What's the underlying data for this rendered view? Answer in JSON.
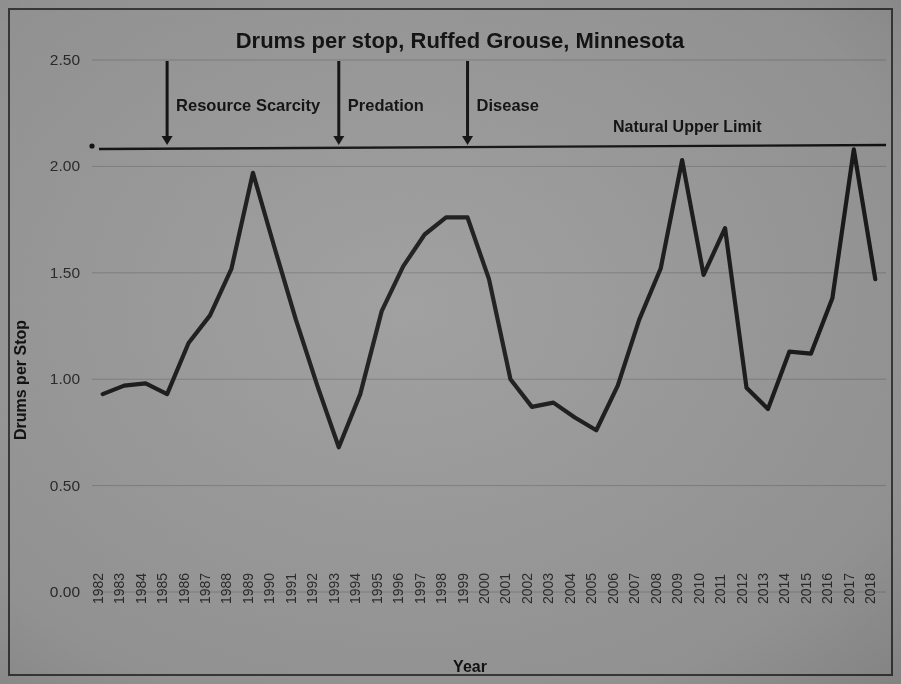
{
  "figure": {
    "background_color": "#9c9c9c",
    "border_color": "#3a3a3a",
    "line_color": "#1a1a1a"
  },
  "chart_data": {
    "type": "line",
    "title": "Drums per stop, Ruffed Grouse, Minnesota",
    "xlabel": "Year",
    "ylabel": "Drums per Stop",
    "grid": true,
    "legend_position": "none",
    "xlim": [
      1982,
      2018
    ],
    "ylim": [
      0.0,
      2.5
    ],
    "ytick_labels": [
      "0.00",
      "0.50",
      "1.00",
      "1.50",
      "2.00",
      "2.50"
    ],
    "ytick_values": [
      0.0,
      0.5,
      1.0,
      1.5,
      2.0,
      2.5
    ],
    "categories": [
      "1982",
      "1983",
      "1984",
      "1985",
      "1986",
      "1987",
      "1988",
      "1989",
      "1990",
      "1991",
      "1992",
      "1993",
      "1994",
      "1995",
      "1996",
      "1997",
      "1998",
      "1999",
      "2000",
      "2001",
      "2002",
      "2003",
      "2004",
      "2005",
      "2006",
      "2007",
      "2008",
      "2009",
      "2010",
      "2011",
      "2012",
      "2013",
      "2014",
      "2015",
      "2016",
      "2017",
      "2018"
    ],
    "series": [
      {
        "name": "Drums per Stop",
        "values": [
          0.93,
          0.97,
          0.98,
          0.93,
          1.17,
          1.3,
          1.52,
          1.97,
          1.62,
          1.28,
          0.97,
          0.68,
          0.93,
          1.32,
          1.53,
          1.68,
          1.76,
          1.76,
          1.47,
          1.0,
          0.87,
          0.89,
          0.82,
          0.76,
          0.97,
          1.28,
          1.52,
          2.03,
          1.49,
          1.71,
          0.96,
          0.86,
          1.13,
          1.12,
          1.38,
          2.08,
          1.47
        ]
      }
    ],
    "reference_lines": [
      {
        "name": "natural-upper-limit",
        "label": "Natural Upper Limit",
        "value": 2.11
      }
    ],
    "annotations": [
      {
        "label": "Resource Scarcity",
        "year": "1985",
        "arrow_to_value": 2.1
      },
      {
        "label": "Predation",
        "year": "1993",
        "arrow_to_value": 2.1
      },
      {
        "label": "Disease",
        "year": "1999",
        "arrow_to_value": 2.1
      }
    ]
  }
}
